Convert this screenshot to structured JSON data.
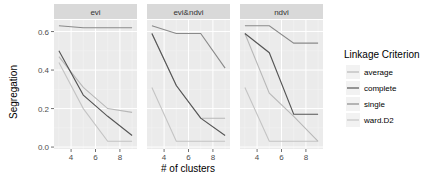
{
  "chart_data": {
    "type": "line",
    "facets": [
      "evi",
      "evi&ndvi",
      "ndvi"
    ],
    "xlabel": "# of clusters",
    "ylabel": "Segregation",
    "x": [
      3,
      5,
      7,
      9
    ],
    "xlim": [
      2.6,
      9.4
    ],
    "ylim": [
      -0.01,
      0.66
    ],
    "xticks": [
      4,
      6,
      8
    ],
    "xtick_labels": [
      "4",
      "6",
      "8"
    ],
    "yticks": [
      0.0,
      0.2,
      0.4,
      0.6
    ],
    "ytick_labels": [
      "0.0",
      "0.2",
      "0.4",
      "0.6"
    ],
    "grid": true,
    "legend": {
      "title": "Linkage Criterion",
      "position": "right",
      "entries": [
        "average",
        "complete",
        "single",
        "ward.D2"
      ]
    },
    "series_colors": {
      "average": "#b8b8b8",
      "complete": "#555555",
      "single": "#8a8a8a",
      "ward.D2": "#c4c4c4"
    },
    "panels": [
      {
        "facet": "evi",
        "series": [
          {
            "name": "average",
            "values": [
              0.47,
              0.31,
              0.2,
              0.18
            ]
          },
          {
            "name": "complete",
            "values": [
              0.5,
              0.27,
              0.16,
              0.06
            ]
          },
          {
            "name": "single",
            "values": [
              0.63,
              0.62,
              0.62,
              0.62
            ]
          },
          {
            "name": "ward.D2",
            "values": [
              0.44,
              0.2,
              0.03,
              0.03
            ]
          }
        ]
      },
      {
        "facet": "evi&ndvi",
        "series": [
          {
            "name": "average",
            "values": [
              0.59,
              0.32,
              0.15,
              0.15
            ]
          },
          {
            "name": "complete",
            "values": [
              0.59,
              0.32,
              0.15,
              0.06
            ]
          },
          {
            "name": "single",
            "values": [
              0.63,
              0.59,
              0.59,
              0.41
            ]
          },
          {
            "name": "ward.D2",
            "values": [
              0.31,
              0.03,
              0.03,
              0.03
            ]
          }
        ]
      },
      {
        "facet": "ndvi",
        "series": [
          {
            "name": "average",
            "values": [
              0.59,
              0.28,
              0.16,
              0.03
            ]
          },
          {
            "name": "complete",
            "values": [
              0.59,
              0.49,
              0.17,
              0.17
            ]
          },
          {
            "name": "single",
            "values": [
              0.63,
              0.63,
              0.54,
              0.54
            ]
          },
          {
            "name": "ward.D2",
            "values": [
              0.31,
              0.03,
              0.03,
              0.03
            ]
          }
        ]
      }
    ]
  }
}
